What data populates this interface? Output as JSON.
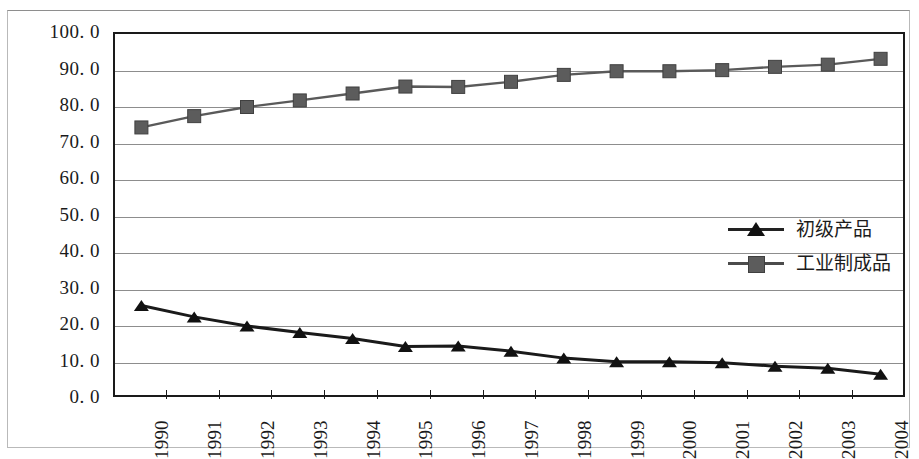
{
  "chart_data": {
    "type": "line",
    "title": "",
    "subtitle": "",
    "xlabel": "",
    "ylabel": "",
    "ylim": [
      0.0,
      100.0
    ],
    "ytick_step": 10.0,
    "grid": true,
    "legend_position": "center-right",
    "categories": [
      "1990",
      "1991",
      "1992",
      "1993",
      "1994",
      "1995",
      "1996",
      "1997",
      "1998",
      "1999",
      "2000",
      "2001",
      "2002",
      "2003",
      "2004"
    ],
    "ytick_labels": [
      "100. 0",
      "90. 0",
      "80. 0",
      "70. 0",
      "60. 0",
      "50. 0",
      "40. 0",
      "30. 0",
      "20. 0",
      "10. 0",
      "0. 0"
    ],
    "ytick_values": [
      100.0,
      90.0,
      80.0,
      70.0,
      60.0,
      50.0,
      40.0,
      30.0,
      20.0,
      10.0,
      0.0
    ],
    "series": [
      {
        "name": "初级产品",
        "marker": "triangle",
        "color": "#1a1a1a",
        "values": [
          25.6,
          22.5,
          20.0,
          18.2,
          16.6,
          14.4,
          14.5,
          13.1,
          11.2,
          10.2,
          10.2,
          9.9,
          9.0,
          8.4,
          6.8
        ]
      },
      {
        "name": "工业制成品",
        "marker": "square",
        "color": "#5c5c5c",
        "values": [
          74.4,
          77.5,
          80.0,
          81.8,
          83.7,
          85.6,
          85.5,
          86.9,
          88.8,
          89.8,
          89.8,
          90.1,
          91.0,
          91.6,
          93.2
        ]
      }
    ]
  },
  "legend": {
    "items": [
      {
        "label": "初级产品",
        "marker": "triangle"
      },
      {
        "label": "工业制成品",
        "marker": "square"
      }
    ]
  }
}
